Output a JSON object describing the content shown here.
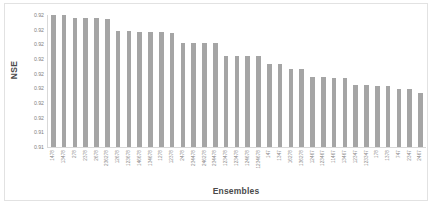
{
  "chart_data": {
    "type": "bar",
    "title": "",
    "xlabel": "Ensembles",
    "ylabel": "NSE",
    "grid": false,
    "legend": "none",
    "bar_color": "#a5a5a5",
    "axis_color": "#d9d9d9",
    "border_color": "#e2e2e2",
    "ylim": [
      0.91,
      0.92
    ],
    "ytick_labels": [
      "0.92",
      "0.92",
      "0.92",
      "0.92",
      "0.92",
      "0.92",
      "0.92",
      "0.92",
      "0.91",
      "0.91"
    ],
    "categories": [
      "1478",
      "13478",
      "278",
      "2378",
      "2678",
      "236278",
      "12678",
      "123678",
      "146678",
      "134678",
      "1278",
      "12378",
      "2478",
      "234478",
      "246278",
      "234478",
      "123478",
      "123478",
      "124678",
      "1234678",
      "147",
      "1347",
      "16278",
      "136278",
      "12467",
      "123467",
      "11467",
      "13467",
      "12347",
      "123347",
      "178",
      "1378",
      "747",
      "2347",
      "2467"
    ],
    "values": [
      0.92,
      0.92,
      0.91975,
      0.91975,
      0.91975,
      0.9197,
      0.9188,
      0.9188,
      0.91868,
      0.91868,
      0.91868,
      0.91866,
      0.9179,
      0.91788,
      0.91788,
      0.91786,
      0.9169,
      0.9169,
      0.9169,
      0.9169,
      0.9163,
      0.91628,
      0.9159,
      0.91588,
      0.9153,
      0.9153,
      0.9152,
      0.9152,
      0.9147,
      0.9147,
      0.91466,
      0.91466,
      0.9144,
      0.91438,
      0.9141
    ]
  },
  "axis": {
    "y_title": "NSE",
    "x_title": "Ensembles"
  }
}
